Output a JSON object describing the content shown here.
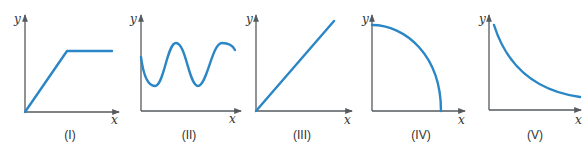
{
  "figure": {
    "colors": {
      "curve": "#2a86c4",
      "axis": "#555a5e",
      "text": "#333333"
    },
    "panels": [
      {
        "id": "I",
        "caption": "(I)",
        "x_label": "x",
        "y_label": "y",
        "shape": "linear rise then constant plateau"
      },
      {
        "id": "II",
        "caption": "(II)",
        "x_label": "x",
        "y_label": "y",
        "shape": "sinusoidal oscillation"
      },
      {
        "id": "III",
        "caption": "(III)",
        "x_label": "x",
        "y_label": "y",
        "shape": "straight line through origin, positive slope"
      },
      {
        "id": "IV",
        "caption": "(IV)",
        "x_label": "x",
        "y_label": "y",
        "shape": "concave-down decreasing arc (quarter circle)"
      },
      {
        "id": "V",
        "caption": "(V)",
        "x_label": "x",
        "y_label": "y",
        "shape": "convex decreasing curve (inverse / decay)"
      }
    ]
  }
}
